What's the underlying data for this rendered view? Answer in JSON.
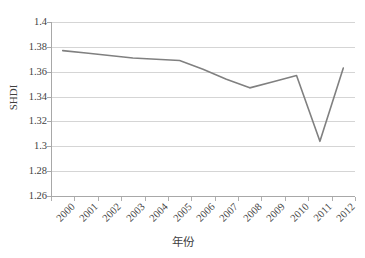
{
  "chart_data": {
    "type": "line",
    "title": "",
    "xlabel": "年份",
    "ylabel": "SHDI",
    "categories": [
      "2000",
      "2001",
      "2002",
      "2003",
      "2004",
      "2005",
      "2006",
      "2007",
      "2008",
      "2009",
      "2010",
      "2011",
      "2012"
    ],
    "values": [
      1.377,
      1.375,
      1.373,
      1.371,
      1.37,
      1.369,
      1.362,
      1.354,
      1.347,
      1.352,
      1.357,
      1.304,
      1.363
    ],
    "series": [
      {
        "name": "SHDI",
        "values": [
          1.377,
          1.375,
          1.373,
          1.371,
          1.37,
          1.369,
          1.362,
          1.354,
          1.347,
          1.352,
          1.357,
          1.304,
          1.363
        ]
      }
    ],
    "ylim": [
      1.26,
      1.4
    ],
    "ytick_labels": [
      "1.4",
      "1.38",
      "1.36",
      "1.34",
      "1.32",
      "1.3",
      "1.28",
      "1.26"
    ],
    "ytick_values": [
      1.4,
      1.38,
      1.36,
      1.34,
      1.32,
      1.3,
      1.28,
      1.26
    ],
    "ytick_step": 0.02,
    "grid": "horizontal",
    "legend": "none",
    "line_color": "#808080",
    "grid_color": "#d5d5d5",
    "axis_color": "#a8a8a8",
    "background_color": "#ffffff"
  }
}
